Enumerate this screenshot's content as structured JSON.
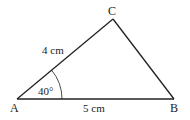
{
  "diagram": {
    "type": "triangle",
    "vertices": {
      "A": {
        "label": "A",
        "x": 17,
        "y": 99
      },
      "B": {
        "label": "B",
        "x": 174,
        "y": 99
      },
      "C": {
        "label": "C",
        "x": 113,
        "y": 19
      }
    },
    "sides": {
      "AC": {
        "label": "4 cm"
      },
      "AB": {
        "label": "5 cm"
      }
    },
    "angles": {
      "A": {
        "label": "40°"
      }
    },
    "colors": {
      "stroke": "#222222",
      "background": "#ffffff"
    }
  }
}
